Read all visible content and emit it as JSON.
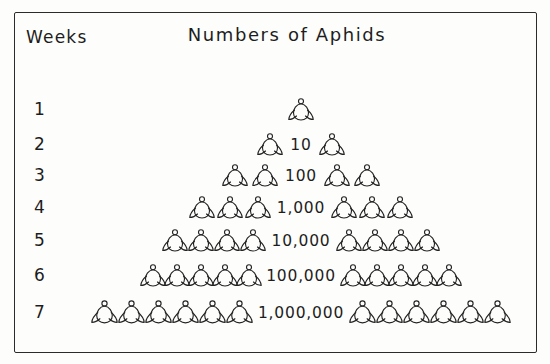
{
  "figure": {
    "background_color": "#fdfdfc",
    "ink_color": "#232323",
    "border_color": "#2b2b2b"
  },
  "header": {
    "weeks_label": "Weeks",
    "title": "Numbers of Aphids"
  },
  "chart_data": {
    "type": "pictogram",
    "title": "Numbers of Aphids",
    "xlabel": "",
    "ylabel": "Weeks",
    "categories": [
      "1",
      "2",
      "3",
      "4",
      "5",
      "6",
      "7"
    ],
    "values": [
      1,
      10,
      100,
      1000,
      10000,
      100000,
      1000000
    ],
    "value_labels": [
      "",
      "10",
      "100",
      "1,000",
      "10,000",
      "100,000",
      "1,000,000"
    ],
    "icon": "aphid-icon",
    "icons_per_side": [
      0,
      1,
      2,
      3,
      4,
      5,
      6
    ],
    "center_icons": [
      1,
      0,
      0,
      0,
      0,
      0,
      0
    ]
  },
  "rows": [
    {
      "week": "1",
      "count_label": "",
      "icons_per_side": 0,
      "center_icons": 1
    },
    {
      "week": "2",
      "count_label": "10",
      "icons_per_side": 1,
      "center_icons": 0
    },
    {
      "week": "3",
      "count_label": "100",
      "icons_per_side": 2,
      "center_icons": 0
    },
    {
      "week": "4",
      "count_label": "1,000",
      "icons_per_side": 3,
      "center_icons": 0
    },
    {
      "week": "5",
      "count_label": "10,000",
      "icons_per_side": 4,
      "center_icons": 0
    },
    {
      "week": "6",
      "count_label": "100,000",
      "icons_per_side": 5,
      "center_icons": 0
    },
    {
      "week": "7",
      "count_label": "1,000,000",
      "icons_per_side": 6,
      "center_icons": 0
    }
  ]
}
